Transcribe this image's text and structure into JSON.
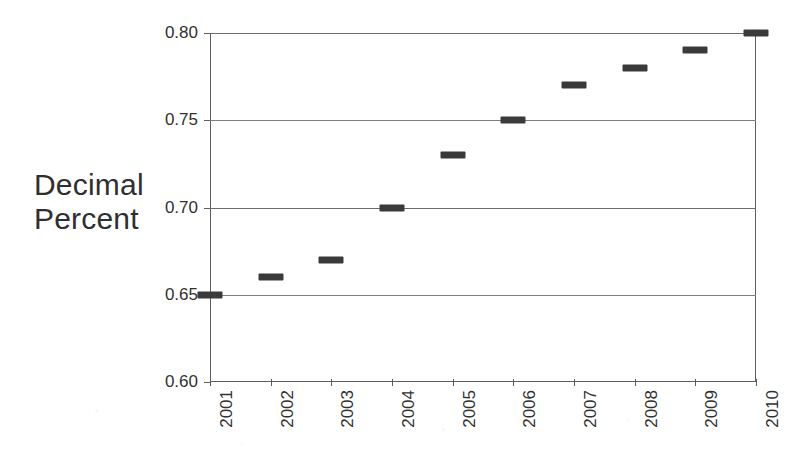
{
  "chart_data": {
    "type": "scatter",
    "title": "",
    "subtitle": "",
    "xlabel": "",
    "ylabel": "Decimal Percent",
    "ylabel_lines": [
      "Decimal",
      "Percent"
    ],
    "categories": [
      "2001",
      "2002",
      "2003",
      "2004",
      "2005",
      "2006",
      "2007",
      "2008",
      "2009",
      "2010"
    ],
    "values": [
      0.65,
      0.66,
      0.67,
      0.7,
      0.73,
      0.75,
      0.77,
      0.78,
      0.79,
      0.8
    ],
    "series": [
      {
        "name": "Decimal Percent",
        "values": [
          0.65,
          0.66,
          0.67,
          0.7,
          0.73,
          0.75,
          0.77,
          0.78,
          0.79,
          0.8
        ]
      }
    ],
    "x_tick_labels": [
      "2001",
      "2002",
      "2003",
      "2004",
      "2005",
      "2006",
      "2007",
      "2008",
      "2009",
      "2010"
    ],
    "y_tick_labels": [
      "0.60",
      "0.65",
      "0.70",
      "0.75",
      "0.80"
    ],
    "y_tick_values": [
      0.6,
      0.65,
      0.7,
      0.75,
      0.8
    ],
    "ylim": [
      0.6,
      0.8
    ],
    "xlim": [
      "2001",
      "2010"
    ],
    "grid": "horizontal",
    "legend": "none",
    "marker_style": "horizontal-dash",
    "colors": {
      "marker": "#3a3a3a",
      "gridline": "#6d6d6d",
      "axis": "#5d5d5d",
      "text": "#2f2f2f",
      "background": "#ffffff"
    }
  }
}
